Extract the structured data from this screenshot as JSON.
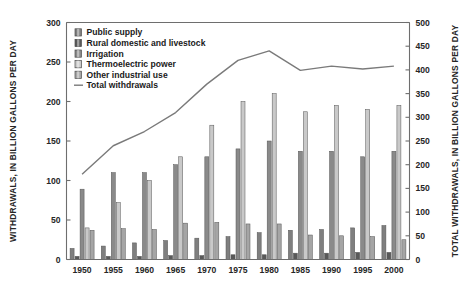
{
  "chart_data": {
    "type": "bar",
    "title": "",
    "subtitle": "",
    "xlabel": "",
    "ylabel": "WITHDRAWALS, IN BILLION GALLONS PER DAY",
    "y2label": "TOTAL WITHDRAWALS, IN BILLION GALLONS PER DAY",
    "categories": [
      "1950",
      "1955",
      "1960",
      "1965",
      "1970",
      "1975",
      "1980",
      "1985",
      "1990",
      "1995",
      "2000"
    ],
    "ylim": [
      0,
      300
    ],
    "yticks": [
      0,
      50,
      100,
      150,
      200,
      250,
      300
    ],
    "y2lim": [
      0,
      500
    ],
    "y2ticks": [
      0,
      50,
      100,
      150,
      200,
      250,
      300,
      350,
      400,
      450,
      500
    ],
    "grid": false,
    "legend_position": "upper-left",
    "series": [
      {
        "name": "Public supply",
        "color": "#7f7f7f",
        "axis": "left",
        "values": [
          14,
          17,
          21,
          24,
          27,
          29,
          34,
          37,
          38,
          40,
          43
        ]
      },
      {
        "name": "Rural domestic and livestock",
        "color": "#595959",
        "axis": "left",
        "values": [
          4,
          4,
          4,
          5,
          5,
          6,
          6,
          8,
          8,
          9,
          9
        ]
      },
      {
        "name": "Irrigation",
        "color": "#8a8a8a",
        "axis": "left",
        "values": [
          89,
          110,
          110,
          120,
          130,
          140,
          150,
          137,
          137,
          130,
          137
        ]
      },
      {
        "name": "Thermoelectric power",
        "color": "#c9c9c9",
        "axis": "left",
        "values": [
          40,
          72,
          100,
          130,
          170,
          200,
          210,
          187,
          195,
          190,
          195
        ]
      },
      {
        "name": "Other industrial use",
        "color": "#a5a5a5",
        "axis": "left",
        "values": [
          37,
          39,
          38,
          46,
          47,
          45,
          45,
          31,
          30,
          29,
          25
        ]
      }
    ],
    "line_series": {
      "name": "Total withdrawals",
      "color": "#7a7a7a",
      "axis": "right",
      "values": [
        180,
        240,
        270,
        310,
        370,
        420,
        440,
        399,
        408,
        402,
        408
      ]
    }
  },
  "legend": {
    "items": [
      {
        "label": "Public supply",
        "swatch": "#7f7f7f",
        "type": "square"
      },
      {
        "label": "Rural domestic and livestock",
        "swatch": "#595959",
        "type": "square"
      },
      {
        "label": "Irrigation",
        "swatch": "#8a8a8a",
        "type": "square"
      },
      {
        "label": "Thermoelectric power",
        "swatch": "#c9c9c9",
        "type": "square"
      },
      {
        "label": "Other industrial use",
        "swatch": "#a5a5a5",
        "type": "square"
      },
      {
        "label": "Total withdrawals",
        "swatch": "#7a7a7a",
        "type": "line"
      }
    ]
  },
  "colors": {
    "axis": "#6e6e6e",
    "text": "#262626",
    "background": "#ffffff"
  }
}
